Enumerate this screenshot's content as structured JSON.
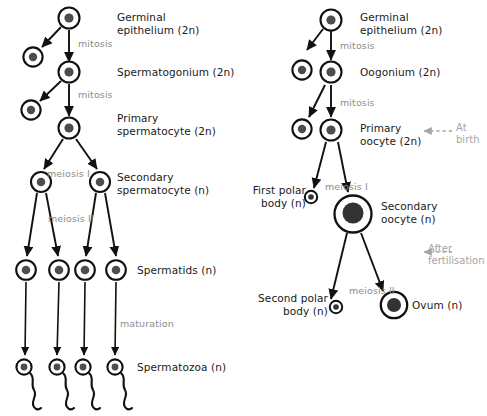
{
  "figure": {
    "colors": {
      "cell_outline": "#111111",
      "nucleus": "#4d4d4d",
      "nucleus_dark": "#333333",
      "label_text": "#1a1a1a",
      "process_text": "#8d8d8d",
      "annotation_text": "#a5a5a5",
      "background": "#ffffff"
    }
  },
  "spermatogenesis": {
    "stage_labels": [
      {
        "id": "germinal-epithelium",
        "text": "Germinal\nepithelium (2n)",
        "x": 117,
        "y": 11
      },
      {
        "id": "spermatogonium",
        "text": "Spermatogonium (2n)",
        "x": 117,
        "y": 66
      },
      {
        "id": "primary-spermatocyte",
        "text": "Primary\nspermatocyte (2n)",
        "x": 117,
        "y": 112
      },
      {
        "id": "secondary-spermatocyte",
        "text": "Secondary\nspermatocyte (n)",
        "x": 117,
        "y": 171
      },
      {
        "id": "spermatids",
        "text": "Spermatids (n)",
        "x": 137,
        "y": 264
      },
      {
        "id": "spermatozoa",
        "text": "Spermatozoa (n)",
        "x": 137,
        "y": 361
      }
    ],
    "process_labels": [
      {
        "id": "mitosis-1",
        "text": "mitosis",
        "x": 78,
        "y": 38
      },
      {
        "id": "mitosis-2",
        "text": "mitosis",
        "x": 78,
        "y": 89
      },
      {
        "id": "meiosis-i",
        "text": "meiosis I",
        "x": 47,
        "y": 168
      },
      {
        "id": "meiosis-ii",
        "text": "meiosis II",
        "x": 48,
        "y": 213
      },
      {
        "id": "maturation",
        "text": "maturation",
        "x": 120,
        "y": 318
      }
    ]
  },
  "oogenesis": {
    "stage_labels": [
      {
        "id": "germinal-epithelium",
        "text": "Germinal\nepithelium (2n)",
        "x": 360,
        "y": 11
      },
      {
        "id": "oogonium",
        "text": "Oogonium (2n)",
        "x": 360,
        "y": 66
      },
      {
        "id": "primary-oocyte",
        "text": "Primary\noocyte (2n)",
        "x": 360,
        "y": 122
      },
      {
        "id": "first-polar-body",
        "text": "First polar\nbody (n)",
        "x": 250,
        "y": 184
      },
      {
        "id": "secondary-oocyte",
        "text": "Secondary\noocyte (n)",
        "x": 381,
        "y": 200
      },
      {
        "id": "second-polar-body",
        "text": "Second polar\nbody (n)",
        "x": 258,
        "y": 292
      },
      {
        "id": "ovum",
        "text": "Ovum (n)",
        "x": 412,
        "y": 299
      }
    ],
    "process_labels": [
      {
        "id": "mitosis-1",
        "text": "mitosis",
        "x": 340,
        "y": 40
      },
      {
        "id": "mitosis-2",
        "text": "mitosis",
        "x": 340,
        "y": 97
      },
      {
        "id": "meiosis-i",
        "text": "meiosis I",
        "x": 325,
        "y": 181
      },
      {
        "id": "meiosis-ii",
        "text": "meiosis II",
        "x": 349,
        "y": 285
      }
    ],
    "annotations": [
      {
        "id": "at-birth",
        "text": "At\nbirth",
        "x": 456,
        "y": 122
      },
      {
        "id": "after-fertilisation",
        "text": "After\nfertilisation",
        "x": 428,
        "y": 243
      }
    ]
  }
}
